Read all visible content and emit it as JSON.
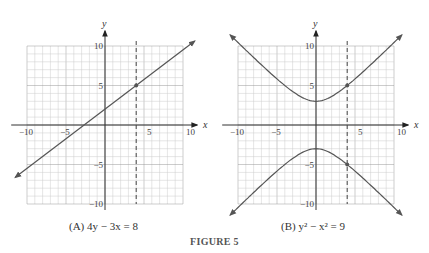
{
  "figure": {
    "title": "FIGURE 5",
    "panels": [
      {
        "caption": "(A)  4y − 3x = 8"
      },
      {
        "caption": "(B)  y² − x² = 9"
      }
    ]
  },
  "chart_data": [
    {
      "type": "line",
      "title": "(A) 4y − 3x = 8",
      "xlabel": "x",
      "ylabel": "y",
      "xlim": [
        -10,
        10
      ],
      "ylim": [
        -10,
        10
      ],
      "xticks": [
        -10,
        -5,
        5,
        10
      ],
      "yticks": [
        10,
        5,
        -5,
        -10
      ],
      "grid": true,
      "equation": "4y - 3x = 8",
      "x": [
        -11.5,
        -4,
        0,
        4,
        11.5
      ],
      "y": [
        -6.625,
        -1,
        2,
        5,
        10.625
      ],
      "marked_point": [
        4,
        5
      ],
      "dashed_vertical_line": 4
    },
    {
      "type": "line",
      "title": "(B) y² − x² = 9",
      "xlabel": "x",
      "ylabel": "y",
      "xlim": [
        -10,
        10
      ],
      "ylim": [
        -10,
        10
      ],
      "xticks": [
        -10,
        -5,
        5,
        10
      ],
      "yticks": [
        10,
        5,
        -5,
        -10
      ],
      "grid": true,
      "equation": "y^2 - x^2 = 9",
      "series": [
        {
          "name": "upper branch",
          "x": [
            -11,
            -8,
            -4,
            0,
            4,
            8,
            11
          ],
          "y": [
            11.4,
            8.54,
            5,
            3,
            5,
            8.54,
            11.4
          ]
        },
        {
          "name": "lower branch",
          "x": [
            -11,
            -8,
            -4,
            0,
            4,
            8,
            11
          ],
          "y": [
            -11.4,
            -8.54,
            -5,
            -3,
            -5,
            -8.54,
            -11.4
          ]
        }
      ],
      "marked_points": [
        [
          4,
          5
        ],
        [
          4,
          -5
        ]
      ],
      "dashed_vertical_line": 4
    }
  ]
}
